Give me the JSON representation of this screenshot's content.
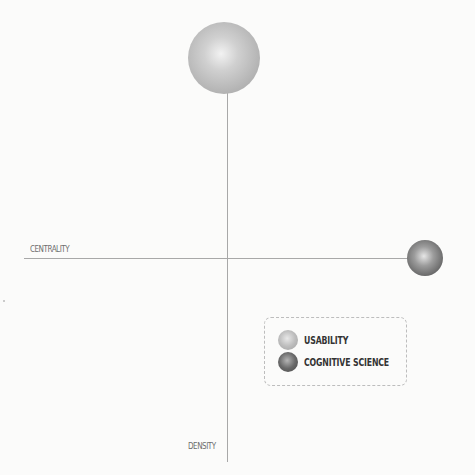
{
  "chart_data": {
    "type": "scatter",
    "subtype": "bubble-quadrant",
    "title": "",
    "xlabel": "CENTRALITY",
    "ylabel": "DENSITY",
    "grid": false,
    "legend_position": "lower-right",
    "axes": {
      "horizontal_label": "CENTRALITY",
      "vertical_label": "DENSITY",
      "origin": "center crossing"
    },
    "series": [
      {
        "name": "USABILITY",
        "color": "#bdbdbd",
        "x": 0.0,
        "y": 0.9,
        "relative_size": 2.0
      },
      {
        "name": "COGNITIVE SCIENCE",
        "color": "#5e5e5e",
        "x": 1.0,
        "y": 0.0,
        "relative_size": 1.0
      }
    ]
  },
  "axes": {
    "centrality_label": "CENTRALITY",
    "density_label": "DENSITY"
  },
  "legend": {
    "items": [
      {
        "label": "USABILITY",
        "color": "#bdbdbd"
      },
      {
        "label": "COGNITIVE SCIENCE",
        "color": "#5e5e5e"
      }
    ]
  }
}
